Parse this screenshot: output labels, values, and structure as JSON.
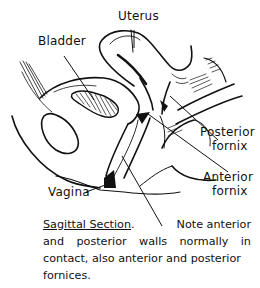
{
  "figure": {
    "title": "Sagittal Section",
    "labels": {
      "uterus": "Uterus",
      "bladder": "Bladder",
      "posterior_fornix_1": "Posterior",
      "posterior_fornix_2": "fornix",
      "anterior_fornix_1": "Anterior",
      "anterior_fornix_2": "fornix",
      "vagina": "Vagina"
    },
    "caption": {
      "title": "Sagittal Section",
      "period": ".",
      "line1_rest": "Note anterior",
      "line2": [
        "and",
        "posterior",
        "walls",
        "normally",
        "in"
      ],
      "line3": "contact, also anterior and posterior",
      "line4": "fornices."
    },
    "colors": {
      "ink": "#111111",
      "background": "#ffffff"
    }
  }
}
